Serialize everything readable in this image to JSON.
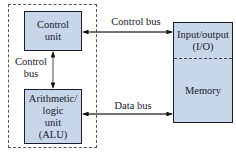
{
  "diagram": {
    "cpu_boundary": {
      "style": "dashed"
    },
    "control_unit": {
      "line1": "Control",
      "line2": "unit"
    },
    "alu": {
      "line1": "Arithmetic/",
      "line2": "logic",
      "line3": "unit",
      "line4": "(ALU)"
    },
    "io_memory": {
      "io_line1": "Input/output",
      "io_line2": "(I/O)",
      "memory": "Memory"
    },
    "edges": {
      "control_bus_top": "Control bus",
      "control_bus_vertical_line1": "Control",
      "control_bus_vertical_line2": "bus",
      "data_bus": "Data bus"
    },
    "colors": {
      "box_fill": "#c8d6ea",
      "stroke": "#1c1c2c"
    }
  }
}
